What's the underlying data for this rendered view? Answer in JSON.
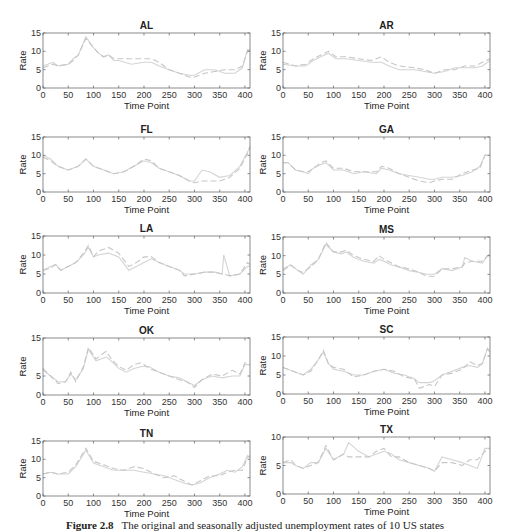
{
  "figure": {
    "caption_label": "Figure 2.8",
    "caption_text": "The original and seasonally adjusted unemployment rates of 10 US states"
  },
  "style": {
    "axis_color": "#6e6e6e",
    "text_color": "#333333",
    "original_line_color": "#d4d4d4",
    "adjusted_line_color": "#c6c6c6"
  },
  "chart_data": [
    {
      "type": "line",
      "title": "AL",
      "xlabel": "Time Point",
      "ylabel": "Rate",
      "xlim": [
        0,
        410
      ],
      "ylim": [
        0,
        15
      ],
      "xticks": [
        0,
        50,
        100,
        150,
        200,
        250,
        300,
        350,
        400
      ],
      "yticks": [
        0,
        5,
        10,
        15
      ],
      "grid": false,
      "x": [
        0,
        20,
        30,
        50,
        60,
        70,
        85,
        100,
        110,
        120,
        130,
        140,
        150,
        175,
        200,
        215,
        230,
        250,
        270,
        290,
        300,
        320,
        340,
        360,
        380,
        395,
        405,
        410
      ],
      "series": [
        {
          "name": "Original",
          "values": [
            6,
            7,
            6,
            6.5,
            8,
            9,
            14,
            11,
            9.5,
            8.5,
            9,
            7.5,
            7.5,
            6.5,
            7,
            7,
            6,
            5,
            4,
            3.5,
            3.5,
            5,
            5,
            4,
            4,
            5.5,
            10.5,
            10
          ]
        },
        {
          "name": "Seasonally Adjusted",
          "values": [
            5.5,
            6.5,
            6,
            6.5,
            7.5,
            9,
            13.5,
            11,
            9.5,
            8.5,
            9,
            8,
            8,
            8,
            8,
            8,
            7,
            5,
            4,
            3,
            3,
            4,
            4.5,
            5,
            5,
            6,
            10,
            10.5
          ]
        }
      ]
    },
    {
      "type": "line",
      "title": "AR",
      "xlabel": "Time Point",
      "ylabel": "Rate",
      "xlim": [
        0,
        410
      ],
      "ylim": [
        0,
        15
      ],
      "xticks": [
        0,
        50,
        100,
        150,
        200,
        250,
        300,
        350,
        400
      ],
      "yticks": [
        0,
        5,
        10,
        15
      ],
      "grid": false,
      "x": [
        0,
        25,
        45,
        60,
        75,
        90,
        105,
        125,
        150,
        175,
        195,
        210,
        230,
        260,
        280,
        300,
        320,
        340,
        360,
        380,
        395,
        410
      ],
      "series": [
        {
          "name": "Original",
          "values": [
            6.5,
            6,
            6,
            7.5,
            8.5,
            9.5,
            8,
            8,
            7.5,
            7,
            7,
            6,
            5,
            5,
            4.5,
            4,
            4.5,
            5.5,
            5.5,
            5.5,
            6,
            7.5
          ]
        },
        {
          "name": "Seasonally Adjusted",
          "values": [
            7,
            6,
            6.5,
            8,
            9,
            10,
            8.5,
            8.5,
            8,
            7.5,
            8.5,
            7,
            6,
            5.5,
            5,
            4,
            5,
            5,
            6,
            6,
            7,
            8
          ]
        }
      ]
    },
    {
      "type": "line",
      "title": "FL",
      "xlabel": "Time Point",
      "ylabel": "Rate",
      "xlim": [
        0,
        410
      ],
      "ylim": [
        0,
        15
      ],
      "xticks": [
        0,
        50,
        100,
        150,
        200,
        250,
        300,
        350,
        400
      ],
      "yticks": [
        0,
        5,
        10,
        15
      ],
      "grid": false,
      "x": [
        0,
        15,
        30,
        50,
        70,
        85,
        100,
        120,
        140,
        160,
        180,
        200,
        215,
        230,
        250,
        270,
        290,
        300,
        315,
        330,
        350,
        370,
        390,
        405,
        410
      ],
      "series": [
        {
          "name": "Original",
          "values": [
            10,
            9,
            7,
            6,
            7,
            9,
            7,
            6,
            5,
            5.5,
            7,
            8.5,
            8,
            6.5,
            5.5,
            4.5,
            3,
            3,
            6,
            5.5,
            4,
            4.5,
            7,
            11,
            12
          ]
        },
        {
          "name": "Seasonally Adjusted",
          "values": [
            9.5,
            8.5,
            7,
            6,
            7,
            9,
            7,
            6,
            5,
            5.5,
            7,
            9,
            8.5,
            6.5,
            5.5,
            4.5,
            3,
            2.5,
            3,
            3,
            3,
            4,
            6.5,
            10.5,
            12.5
          ]
        }
      ]
    },
    {
      "type": "line",
      "title": "GA",
      "xlabel": "Time Point",
      "ylabel": "Rate",
      "xlim": [
        0,
        410
      ],
      "ylim": [
        0,
        15
      ],
      "xticks": [
        0,
        50,
        100,
        150,
        200,
        250,
        300,
        350,
        400
      ],
      "yticks": [
        0,
        5,
        10,
        15
      ],
      "grid": false,
      "x": [
        0,
        10,
        25,
        40,
        50,
        60,
        75,
        85,
        100,
        120,
        140,
        160,
        185,
        195,
        210,
        230,
        250,
        270,
        290,
        300,
        315,
        335,
        355,
        375,
        390,
        400,
        410
      ],
      "series": [
        {
          "name": "Original",
          "values": [
            8,
            8,
            6,
            5.5,
            5,
            6.5,
            7.5,
            8,
            6,
            6,
            5,
            5.5,
            5,
            6.5,
            6,
            5,
            4.5,
            4,
            3.5,
            3.5,
            4,
            4,
            4.5,
            5.5,
            7,
            10,
            10
          ]
        },
        {
          "name": "Seasonally Adjusted",
          "values": [
            8,
            8,
            6,
            5.5,
            5.5,
            6.5,
            8,
            8.5,
            6.5,
            6.5,
            5.5,
            5.5,
            5.5,
            7,
            6.5,
            5,
            4,
            3,
            2.5,
            3,
            3.5,
            3.5,
            5,
            6,
            6.5,
            10,
            10.5
          ]
        }
      ]
    },
    {
      "type": "line",
      "title": "LA",
      "xlabel": "Time Point",
      "ylabel": "Rate",
      "xlim": [
        0,
        410
      ],
      "ylim": [
        0,
        15
      ],
      "xticks": [
        0,
        50,
        100,
        150,
        200,
        250,
        300,
        350,
        400
      ],
      "yticks": [
        0,
        5,
        10,
        15
      ],
      "grid": false,
      "x": [
        0,
        15,
        25,
        35,
        50,
        65,
        80,
        90,
        100,
        110,
        130,
        150,
        170,
        185,
        200,
        215,
        230,
        250,
        270,
        280,
        300,
        320,
        340,
        355,
        358,
        370,
        390,
        405,
        410
      ],
      "series": [
        {
          "name": "Original",
          "values": [
            6,
            7,
            7.5,
            6,
            7,
            8,
            10,
            12,
            9.5,
            10,
            10.5,
            9.5,
            6,
            7,
            8,
            9,
            8,
            7,
            6,
            5,
            5,
            5.5,
            5.5,
            5,
            10,
            4.5,
            5,
            7,
            7
          ]
        },
        {
          "name": "Seasonally Adjusted",
          "values": [
            6,
            6.5,
            7.5,
            6,
            7,
            8,
            10.5,
            12.5,
            9.5,
            11,
            12,
            10.5,
            7,
            8,
            9.5,
            9.5,
            8,
            7,
            6,
            4.5,
            5,
            5.5,
            5.5,
            5,
            5,
            4.5,
            5,
            8,
            7.5
          ]
        }
      ]
    },
    {
      "type": "line",
      "title": "MS",
      "xlabel": "Time Point",
      "ylabel": "Rate",
      "xlim": [
        0,
        410
      ],
      "ylim": [
        0,
        15
      ],
      "xticks": [
        0,
        50,
        100,
        150,
        200,
        250,
        300,
        350,
        400
      ],
      "yticks": [
        0,
        5,
        10,
        15
      ],
      "grid": false,
      "x": [
        0,
        15,
        30,
        40,
        55,
        70,
        85,
        100,
        115,
        125,
        140,
        160,
        180,
        190,
        200,
        215,
        230,
        250,
        270,
        285,
        300,
        315,
        335,
        355,
        360,
        375,
        395,
        405,
        410
      ],
      "series": [
        {
          "name": "Original",
          "values": [
            6.5,
            7.5,
            6,
            5,
            7.5,
            9,
            13,
            11,
            10.5,
            11,
            9.5,
            8.5,
            8,
            9,
            8.5,
            7.5,
            7,
            6,
            5.5,
            5,
            5,
            6.5,
            6,
            7,
            9.5,
            8.5,
            8,
            10,
            10
          ]
        },
        {
          "name": "Seasonally Adjusted",
          "values": [
            6,
            7.5,
            6,
            5.5,
            7,
            9,
            13.5,
            11,
            11,
            11.5,
            10,
            9,
            8.5,
            10,
            9,
            8,
            7,
            6.5,
            5.5,
            4.5,
            4.5,
            6.5,
            6.5,
            7,
            8,
            8.5,
            8.5,
            10,
            10.5
          ]
        }
      ]
    },
    {
      "type": "line",
      "title": "OK",
      "xlabel": "Time Point",
      "ylabel": "Rate",
      "xlim": [
        0,
        410
      ],
      "ylim": [
        0,
        15
      ],
      "xticks": [
        0,
        50,
        100,
        150,
        200,
        250,
        300,
        350,
        400
      ],
      "yticks": [
        0,
        5,
        15
      ],
      "grid": false,
      "x": [
        0,
        15,
        30,
        45,
        55,
        65,
        80,
        90,
        105,
        125,
        135,
        150,
        165,
        180,
        195,
        210,
        230,
        250,
        270,
        285,
        300,
        315,
        335,
        355,
        375,
        390,
        400,
        410
      ],
      "series": [
        {
          "name": "Original",
          "values": [
            6.5,
            5,
            3.5,
            3.5,
            5.5,
            4,
            7,
            12,
            9,
            10,
            9,
            7,
            6,
            7,
            7.5,
            7.5,
            6,
            5,
            4.5,
            3.5,
            2.5,
            4,
            5,
            4.5,
            5,
            5,
            8,
            8
          ]
        },
        {
          "name": "Seasonally Adjusted",
          "values": [
            7,
            5,
            3,
            3.5,
            6,
            3.5,
            7.5,
            12.5,
            9.5,
            11.5,
            9.5,
            7.5,
            6.5,
            8,
            8.5,
            7,
            6,
            5,
            4,
            3.5,
            2,
            4,
            5.5,
            5,
            6.5,
            5.5,
            8.5,
            8
          ]
        }
      ]
    },
    {
      "type": "line",
      "title": "SC",
      "xlabel": "Time Point",
      "ylabel": "Rate",
      "xlim": [
        0,
        410
      ],
      "ylim": [
        0,
        15
      ],
      "xticks": [
        0,
        50,
        100,
        150,
        200,
        250,
        300,
        350,
        400
      ],
      "yticks": [
        0,
        5,
        10,
        15
      ],
      "grid": false,
      "x": [
        0,
        20,
        40,
        55,
        70,
        80,
        90,
        100,
        120,
        140,
        160,
        180,
        200,
        220,
        240,
        260,
        270,
        290,
        300,
        315,
        335,
        355,
        370,
        385,
        395,
        405,
        410
      ],
      "series": [
        {
          "name": "Original",
          "values": [
            7,
            6,
            5,
            6.5,
            9,
            11,
            8,
            6.5,
            6,
            5,
            5,
            6,
            6.5,
            5.5,
            5,
            4,
            3,
            3,
            3.5,
            5,
            6,
            7,
            7.5,
            7,
            8,
            12,
            11
          ]
        },
        {
          "name": "Seasonally Adjusted",
          "values": [
            7,
            6,
            5,
            6,
            9,
            11.5,
            8,
            7,
            6.5,
            4.5,
            5,
            6,
            6.5,
            6,
            4.5,
            4,
            1.5,
            2.5,
            2,
            5,
            5.5,
            6.5,
            8.5,
            7.5,
            8,
            12,
            11
          ]
        }
      ]
    },
    {
      "type": "line",
      "title": "TN",
      "xlabel": "Time Point",
      "ylabel": "Rate",
      "xlim": [
        0,
        410
      ],
      "ylim": [
        0,
        15
      ],
      "xticks": [
        0,
        50,
        100,
        150,
        200,
        250,
        300,
        350,
        400
      ],
      "yticks": [
        0,
        5,
        10,
        15
      ],
      "grid": false,
      "x": [
        0,
        15,
        30,
        50,
        65,
        85,
        100,
        120,
        140,
        160,
        180,
        200,
        220,
        240,
        260,
        280,
        295,
        310,
        330,
        350,
        365,
        380,
        395,
        405,
        410
      ],
      "series": [
        {
          "name": "Original",
          "values": [
            6,
            6.5,
            6,
            6,
            8,
            12.5,
            9,
            8,
            7,
            7,
            7,
            6.5,
            6,
            5.5,
            4.5,
            3.5,
            3,
            3.5,
            5,
            6,
            7,
            6.5,
            8,
            11,
            10.5
          ]
        },
        {
          "name": "Seasonally Adjusted",
          "values": [
            6,
            6.5,
            6,
            6.5,
            8.5,
            13,
            9.5,
            8.5,
            7.5,
            7,
            8,
            7.5,
            6,
            5,
            5.5,
            4,
            3,
            4,
            5.5,
            5.5,
            6.5,
            7,
            7,
            10.5,
            11
          ]
        }
      ]
    },
    {
      "type": "line",
      "title": "TX",
      "xlabel": "Time Point",
      "ylabel": "Rate",
      "xlim": [
        0,
        410
      ],
      "ylim": [
        0,
        10
      ],
      "xticks": [
        0,
        50,
        100,
        150,
        200,
        250,
        300,
        350,
        400
      ],
      "yticks": [
        0,
        5,
        10
      ],
      "grid": false,
      "x": [
        0,
        15,
        25,
        40,
        55,
        70,
        85,
        100,
        120,
        130,
        150,
        170,
        185,
        200,
        215,
        230,
        250,
        270,
        290,
        300,
        315,
        335,
        355,
        370,
        385,
        400,
        410
      ],
      "series": [
        {
          "name": "Original",
          "values": [
            5.5,
            5.5,
            5,
            4.5,
            5.5,
            5.5,
            8,
            6,
            7,
            9,
            7.5,
            6.5,
            7,
            7.5,
            7,
            6,
            5.5,
            5,
            4.5,
            4,
            6.5,
            6,
            5.5,
            5,
            4.5,
            8,
            8
          ]
        },
        {
          "name": "Seasonally Adjusted",
          "values": [
            5.5,
            6,
            5,
            4.5,
            5,
            5.5,
            8.5,
            6,
            7,
            6.5,
            6.5,
            6.5,
            7.5,
            8,
            6.5,
            6.5,
            5.5,
            5,
            4.5,
            4,
            5.5,
            5.5,
            5,
            6,
            6,
            7.5,
            8
          ]
        }
      ]
    }
  ],
  "layout": {
    "panels": [
      {
        "x": 43,
        "y": 33,
        "w": 207,
        "h": 55
      },
      {
        "x": 283,
        "y": 33,
        "w": 207,
        "h": 55
      },
      {
        "x": 43,
        "y": 137,
        "w": 207,
        "h": 55
      },
      {
        "x": 283,
        "y": 137,
        "w": 207,
        "h": 55
      },
      {
        "x": 43,
        "y": 236,
        "w": 207,
        "h": 57
      },
      {
        "x": 283,
        "y": 237,
        "w": 207,
        "h": 56
      },
      {
        "x": 43,
        "y": 338,
        "w": 207,
        "h": 57
      },
      {
        "x": 283,
        "y": 337,
        "w": 207,
        "h": 57
      },
      {
        "x": 43,
        "y": 441,
        "w": 207,
        "h": 55
      },
      {
        "x": 283,
        "y": 437,
        "w": 207,
        "h": 57
      }
    ]
  }
}
